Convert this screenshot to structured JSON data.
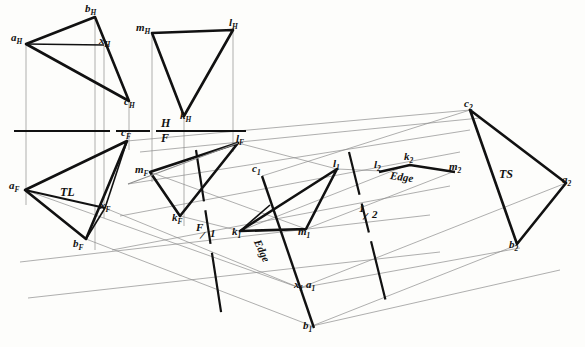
{
  "drawing": {
    "title": "Descriptive geometry multiview: edge view and true size of planes",
    "ink_color": "#111111",
    "thin_color": "#8a8a8a",
    "background": "#fdfdfb",
    "width": 585,
    "height": 347
  },
  "fold_lines": [
    {
      "name": "H/F",
      "upper_label": "H",
      "lower_label": "F",
      "x": 173,
      "y": 131
    },
    {
      "name": "F/1",
      "upper_label": "F",
      "lower_label": "1",
      "x": 205,
      "y": 232
    },
    {
      "name": "1/2",
      "upper_label": "1",
      "lower_label": "2",
      "x": 366,
      "y": 214
    }
  ],
  "annotations": [
    {
      "name": "true-length",
      "text": "TL",
      "x": 62,
      "y": 188
    },
    {
      "name": "true-size",
      "text": "TS",
      "x": 501,
      "y": 170
    },
    {
      "name": "edge-view-1",
      "text": "Edge",
      "x": 263,
      "y": 240
    },
    {
      "name": "edge-view-2",
      "text": "Edge",
      "x": 393,
      "y": 172
    }
  ],
  "views": {
    "horizontal": {
      "label": "H",
      "triangle_abc": {
        "vertices": [
          {
            "name": "a",
            "label": "a",
            "sub": "H",
            "x": 26,
            "y": 44,
            "lx": 12,
            "ly": 33
          },
          {
            "name": "b",
            "label": "b",
            "sub": "H",
            "x": 95,
            "y": 17,
            "lx": 86,
            "ly": 5
          },
          {
            "name": "c",
            "label": "c",
            "sub": "H",
            "x": 129,
            "y": 101,
            "lx": 124,
            "ly": 96
          }
        ],
        "cut_point": {
          "name": "x",
          "label": "x",
          "sub": "H",
          "x": 104,
          "y": 45,
          "lx": 99,
          "ly": 35
        }
      },
      "triangle_mkl": {
        "vertices": [
          {
            "name": "m",
            "label": "m",
            "sub": "H",
            "x": 152,
            "y": 33,
            "lx": 137,
            "ly": 23
          },
          {
            "name": "l",
            "label": "l",
            "sub": "H",
            "x": 233,
            "y": 30,
            "lx": 230,
            "ly": 18
          },
          {
            "name": "k",
            "label": "k",
            "sub": "H",
            "x": 184,
            "y": 116,
            "lx": 181,
            "ly": 110
          }
        ]
      }
    },
    "frontal": {
      "label": "F",
      "triangle_abc": {
        "vertices": [
          {
            "name": "a",
            "label": "a",
            "sub": "F",
            "x": 25,
            "y": 190,
            "lx": 10,
            "ly": 180
          },
          {
            "name": "b",
            "label": "b",
            "sub": "F",
            "x": 86,
            "y": 239,
            "lx": 74,
            "ly": 239
          },
          {
            "name": "c",
            "label": "c",
            "sub": "F",
            "x": 127,
            "y": 141,
            "lx": 122,
            "ly": 128
          }
        ],
        "cut_point": {
          "name": "x",
          "label": "x",
          "sub": "F",
          "x": 105,
          "y": 208,
          "lx": 100,
          "ly": 200
        }
      },
      "triangle_mkl": {
        "vertices": [
          {
            "name": "m",
            "label": "m",
            "sub": "F",
            "x": 150,
            "y": 172,
            "lx": 136,
            "ly": 164
          },
          {
            "name": "k",
            "label": "k",
            "sub": "F",
            "x": 180,
            "y": 216,
            "lx": 173,
            "ly": 212
          },
          {
            "name": "l",
            "label": "l",
            "sub": "F",
            "x": 238,
            "y": 143,
            "lx": 236,
            "ly": 133
          }
        ]
      }
    },
    "auxiliary_1": {
      "label": "1",
      "triangle_mkl": {
        "vertices": [
          {
            "name": "k",
            "label": "k",
            "sub": "1",
            "x": 240,
            "y": 231,
            "lx": 232,
            "ly": 228
          },
          {
            "name": "m",
            "label": "m",
            "sub": "1",
            "x": 306,
            "y": 229,
            "lx": 298,
            "ly": 226
          },
          {
            "name": "l",
            "label": "l",
            "sub": "1",
            "x": 337,
            "y": 169,
            "lx": 334,
            "ly": 160
          }
        ]
      },
      "edge_line_abc": {
        "points": [
          {
            "name": "c",
            "label": "c",
            "sub": "1",
            "x": 262,
            "y": 176,
            "lx": 254,
            "ly": 163
          },
          {
            "name": "xa",
            "label": "x",
            "sub": "1",
            "label2": "a",
            "sub2": "1",
            "x": 300,
            "y": 288,
            "lx": 296,
            "ly": 279
          },
          {
            "name": "b",
            "label": "b",
            "sub": "1",
            "x": 312,
            "y": 325,
            "lx": 305,
            "ly": 320
          }
        ]
      }
    },
    "auxiliary_2": {
      "label": "2",
      "edge_line_mkl": {
        "points": [
          {
            "name": "l",
            "label": "l",
            "sub": "2",
            "x": 382,
            "y": 171,
            "lx": 375,
            "ly": 160
          },
          {
            "name": "k",
            "label": "k",
            "sub": "2",
            "x": 410,
            "y": 163,
            "lx": 405,
            "ly": 153
          },
          {
            "name": "m",
            "label": "m",
            "sub": "2",
            "x": 455,
            "y": 171,
            "lx": 450,
            "ly": 162
          }
        ]
      },
      "triangle_abc": {
        "vertices": [
          {
            "name": "c",
            "label": "c",
            "sub": "2",
            "x": 470,
            "y": 110,
            "lx": 465,
            "ly": 98
          },
          {
            "name": "a",
            "label": "a",
            "sub": "2",
            "x": 566,
            "y": 183,
            "lx": 562,
            "ly": 175
          },
          {
            "name": "b",
            "label": "b",
            "sub": "2",
            "x": 517,
            "y": 244,
            "lx": 510,
            "ly": 240
          }
        ]
      }
    }
  }
}
